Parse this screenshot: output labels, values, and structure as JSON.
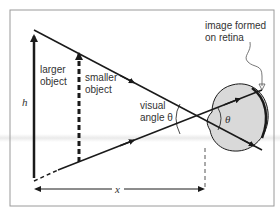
{
  "diagram": {
    "labels": {
      "larger_object": [
        "larger",
        "object"
      ],
      "smaller_object": [
        "smaller",
        "object"
      ],
      "visual_angle": [
        "visual",
        "angle θ"
      ],
      "retina_image": [
        "image formed",
        "on retina"
      ],
      "height_symbol": "h",
      "distance_symbol": "x",
      "theta_inside_eye": "θ"
    },
    "colors": {
      "line": "#1a1a1a",
      "eye_fill": "#d9d9d9",
      "frame": "#9a9a9a",
      "text": "#333333"
    }
  }
}
